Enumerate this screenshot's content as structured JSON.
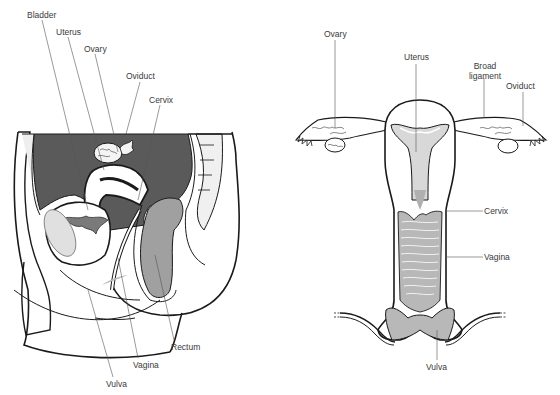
{
  "colors": {
    "dark_fill": "#5a5a5a",
    "mid_fill": "#a8a8a8",
    "light_fill": "#e6e6e6",
    "line": "#1a1a1a",
    "leader": "#555555",
    "text": "#3a3a3a"
  },
  "sagittal_view": {
    "labels": {
      "bladder": "Bladder",
      "uterus": "Uterus",
      "ovary": "Ovary",
      "oviduct": "Oviduct",
      "cervix": "Cervix",
      "rectum": "Rectum",
      "vagina": "Vagina",
      "vulva": "Vulva"
    }
  },
  "frontal_view": {
    "labels": {
      "ovary": "Ovary",
      "uterus": "Uterus",
      "broad_ligament_line1": "Broad",
      "broad_ligament_line2": "ligament",
      "oviduct": "Oviduct",
      "cervix": "Cervix",
      "vagina": "Vagina",
      "vulva": "Vulva"
    }
  }
}
